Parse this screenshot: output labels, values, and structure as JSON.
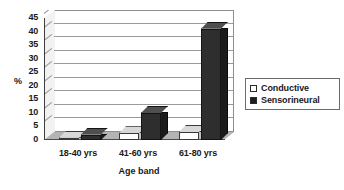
{
  "chart_data": {
    "type": "bar",
    "title": "",
    "subtitle": "",
    "xlabel": "Age band",
    "ylabel": "%",
    "categories": [
      "18-40 yrs",
      "41-60 yrs",
      "61-80 yrs"
    ],
    "series": [
      {
        "name": "Conductive",
        "color": "#ffffff",
        "values": [
          0.8,
          2.5,
          3.0
        ]
      },
      {
        "name": "Sensorineural",
        "color": "#1d1d1d",
        "values": [
          2.0,
          10.0,
          41.0
        ]
      }
    ],
    "ylim": [
      0,
      45
    ],
    "ytick_step": 5,
    "ytick_labels": [
      "0",
      "5",
      "10",
      "15",
      "20",
      "25",
      "30",
      "35",
      "40",
      "45"
    ],
    "grid": true,
    "grid_axis": "y",
    "legend_position": "right",
    "style": "3d-column"
  },
  "legend": {
    "items": [
      {
        "label": "Conductive",
        "swatch": "white-square"
      },
      {
        "label": "Sensorineural",
        "swatch": "black-square"
      }
    ]
  }
}
